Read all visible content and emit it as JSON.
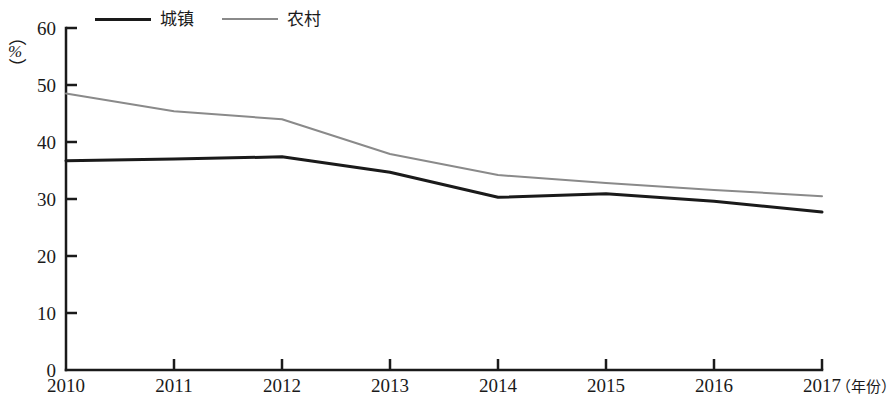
{
  "legend": {
    "position": "top-left",
    "entries": [
      {
        "label": "城镇",
        "key": "urban",
        "color": "#1a1a1a",
        "width": 3
      },
      {
        "label": "农村",
        "key": "rural",
        "color": "#8a8a8a",
        "width": 2
      }
    ]
  },
  "axis": {
    "y_unit_open": "（",
    "y_unit_symbol": "%",
    "y_unit_close": "）",
    "x_title": "（年份）"
  },
  "chart_data": {
    "type": "line",
    "title": "",
    "xlabel": "（年份）",
    "ylabel": "（%）",
    "categories": [
      "2010",
      "2011",
      "2012",
      "2013",
      "2014",
      "2015",
      "2016",
      "2017"
    ],
    "x": [
      2010,
      2011,
      2012,
      2013,
      2014,
      2015,
      2016,
      2017
    ],
    "ylim": [
      0,
      60
    ],
    "yticks": [
      0,
      10,
      20,
      30,
      40,
      50,
      60
    ],
    "grid": false,
    "series": [
      {
        "name": "城镇",
        "color": "#1a1a1a",
        "width": 3,
        "values": [
          36.7,
          37.0,
          37.4,
          34.7,
          30.3,
          30.9,
          29.6,
          27.7
        ]
      },
      {
        "name": "农村",
        "color": "#8a8a8a",
        "width": 2,
        "values": [
          48.5,
          45.4,
          44.0,
          37.9,
          34.2,
          32.8,
          31.6,
          30.5
        ]
      }
    ]
  }
}
